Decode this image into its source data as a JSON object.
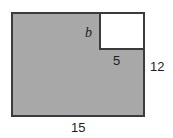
{
  "figure": {
    "kind": "composite-rectangle-diagram",
    "canvas": {
      "width": 173,
      "height": 138,
      "background": "#ffffff"
    },
    "colors": {
      "shaded_fill": "#a8a8a8",
      "notch_fill": "#ffffff",
      "stroke": "#3b3b3b",
      "label_text": "#1d1d1d"
    },
    "shapes": {
      "outer_rectangle": {
        "name": "outer-rect",
        "fill": "#a8a8a8",
        "stroke": "#3b3b3b",
        "stroke_width": 2,
        "x": 11,
        "y": 12,
        "width": 134,
        "height": 105
      },
      "notch_rectangle": {
        "name": "notch-rect",
        "fill": "#ffffff",
        "stroke": "#3b3b3b",
        "stroke_width": 2,
        "x": 99,
        "y": 12,
        "width": 46,
        "height": 38
      }
    },
    "labels": {
      "b": {
        "text": "b",
        "style": "italic-variable",
        "position": "left of notch rectangle, interior"
      },
      "five": {
        "text": "5",
        "style": "numeric",
        "position": "below notch rectangle, on shaded area"
      },
      "twelve": {
        "text": "12",
        "style": "numeric",
        "position": "right of outer rectangle, vertical dimension"
      },
      "fifteen": {
        "text": "15",
        "style": "numeric",
        "position": "below outer rectangle, horizontal dimension"
      }
    }
  }
}
